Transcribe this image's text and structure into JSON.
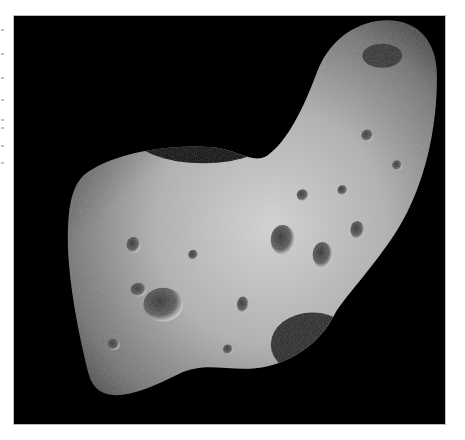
{
  "image": {
    "subject": "asteroid surface photograph",
    "alt": "Grayscale photo of a saddle-shaped, heavily cratered asteroid against a black sky",
    "background": "#000000",
    "surface_colors": {
      "highlight": "#d9d9d9",
      "mid": "#8f8f8f",
      "shadow": "#3a3a3a"
    }
  },
  "page": {
    "background": "#ffffff"
  }
}
